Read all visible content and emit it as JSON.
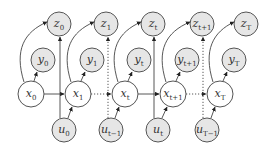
{
  "diagram": {
    "type": "graphical-model",
    "colors": {
      "observed_fill": "#e6e6e6",
      "latent_fill": "#ffffff",
      "stroke": "#555555"
    },
    "nodes": [
      {
        "id": "z0",
        "base": "z",
        "sub": "0",
        "x": 59,
        "y": 24,
        "r": 12,
        "observed": true
      },
      {
        "id": "z1",
        "base": "z",
        "sub": "1",
        "x": 106,
        "y": 24,
        "r": 12,
        "observed": true
      },
      {
        "id": "zt",
        "base": "z",
        "sub": "t",
        "x": 153,
        "y": 24,
        "r": 12,
        "observed": true
      },
      {
        "id": "zt1",
        "base": "z",
        "sub": "t+1",
        "x": 202,
        "y": 24,
        "r": 12,
        "observed": true
      },
      {
        "id": "zT",
        "base": "z",
        "sub": "T",
        "x": 246,
        "y": 24,
        "r": 12,
        "observed": true
      },
      {
        "id": "y0",
        "base": "y",
        "sub": "0",
        "x": 43,
        "y": 60,
        "r": 12,
        "observed": true
      },
      {
        "id": "y1",
        "base": "y",
        "sub": "1",
        "x": 92,
        "y": 60,
        "r": 12,
        "observed": true
      },
      {
        "id": "yt",
        "base": "y",
        "sub": "t",
        "x": 139,
        "y": 60,
        "r": 12,
        "observed": true
      },
      {
        "id": "yt1",
        "base": "y",
        "sub": "t+1",
        "x": 187,
        "y": 60,
        "r": 12,
        "observed": true
      },
      {
        "id": "yT",
        "base": "y",
        "sub": "T",
        "x": 234,
        "y": 60,
        "r": 12,
        "observed": true
      },
      {
        "id": "x0",
        "base": "x",
        "sub": "0",
        "x": 31,
        "y": 94,
        "r": 13,
        "observed": false
      },
      {
        "id": "x1",
        "base": "x",
        "sub": "1",
        "x": 78,
        "y": 94,
        "r": 13,
        "observed": false
      },
      {
        "id": "xt",
        "base": "x",
        "sub": "t",
        "x": 125,
        "y": 94,
        "r": 13,
        "observed": false
      },
      {
        "id": "xt1",
        "base": "x",
        "sub": "t+1",
        "x": 173,
        "y": 94,
        "r": 13,
        "observed": false
      },
      {
        "id": "xT",
        "base": "x",
        "sub": "T",
        "x": 220,
        "y": 94,
        "r": 13,
        "observed": false
      },
      {
        "id": "u0",
        "base": "u",
        "sub": "0",
        "x": 64,
        "y": 130,
        "r": 12,
        "observed": true
      },
      {
        "id": "ut_1",
        "base": "u",
        "sub": "t−1",
        "x": 111,
        "y": 130,
        "r": 12,
        "observed": true
      },
      {
        "id": "ut",
        "base": "u",
        "sub": "t",
        "x": 158,
        "y": 130,
        "r": 12,
        "observed": true
      },
      {
        "id": "uT_1",
        "base": "u",
        "sub": "T−1",
        "x": 207,
        "y": 130,
        "r": 12,
        "observed": true
      }
    ]
  }
}
